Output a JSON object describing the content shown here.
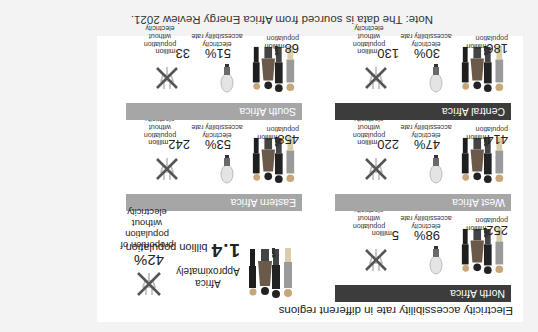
{
  "title": "Electricity accessibility rate in different regions",
  "note": "Note: The data is sourced from Africa Energy Review 2021.",
  "labels": {
    "million": "million",
    "population": "population",
    "rate_label": "electricity accessibility rate",
    "without_label": "population without electricity"
  },
  "summary": {
    "region": "Africa",
    "approx": "Approximately",
    "population_number": "1.4",
    "population_unit": "billion population",
    "percent": "42%",
    "percent_label": "proportion of population without electricity"
  },
  "regions": [
    {
      "name": "North Africa",
      "color": "#3c3c3c",
      "population": "252",
      "rate": "98%",
      "without": "5"
    },
    {
      "name": "West Africa",
      "color": "#a6a6a6",
      "population": "414",
      "rate": "47%",
      "without": "220"
    },
    {
      "name": "Central Africa",
      "color": "#3c3c3c",
      "population": "186",
      "rate": "30%",
      "without": "130"
    },
    {
      "name": "Eastern Africa",
      "color": "#a6a6a6",
      "population": "458",
      "rate": "53%",
      "without": "242"
    },
    {
      "name": "South Africa",
      "color": "#a6a6a6",
      "population": "68",
      "rate": "51%",
      "without": "33"
    }
  ],
  "colors": {
    "dark_header": "#3c3c3c",
    "light_header": "#a6a6a6",
    "background": "#f3f3f3",
    "panel": "#ffffff"
  },
  "icons": {
    "people": "people-group-icon",
    "bulb": "light-bulb-icon",
    "no_power": "crossed-out-plug-icon"
  }
}
